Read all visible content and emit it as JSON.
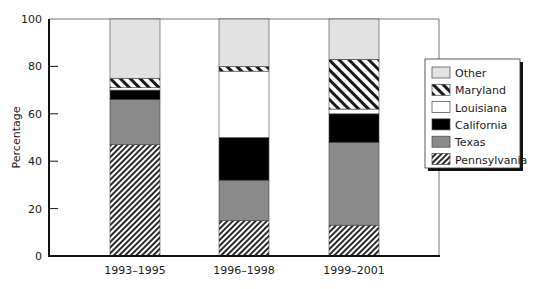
{
  "chart_data": {
    "type": "bar",
    "stacked": true,
    "title": "",
    "xlabel": "",
    "ylabel": "Percentage",
    "ylim": [
      0,
      100
    ],
    "yticks": [
      0,
      20,
      40,
      60,
      80,
      100
    ],
    "grid": false,
    "legend_position": "right",
    "categories": [
      "1993–1995",
      "1996–1998",
      "1999–2001"
    ],
    "series": [
      {
        "name": "Pennsylvania",
        "fill": "hatch-dense",
        "values": [
          47,
          15,
          13
        ]
      },
      {
        "name": "Texas",
        "fill": "#8a8a8a",
        "values": [
          19,
          17,
          35
        ]
      },
      {
        "name": "California",
        "fill": "#000000",
        "values": [
          4,
          18,
          12
        ]
      },
      {
        "name": "Louisiana",
        "fill": "#ffffff",
        "values": [
          1,
          28,
          2
        ]
      },
      {
        "name": "Maryland",
        "fill": "hatch-wide",
        "values": [
          4,
          2,
          21
        ]
      },
      {
        "name": "Other",
        "fill": "#e2e2e2",
        "values": [
          25,
          20,
          17
        ]
      }
    ],
    "legend_order": [
      "Other",
      "Maryland",
      "Louisiana",
      "California",
      "Texas",
      "Pennsylvania"
    ]
  }
}
